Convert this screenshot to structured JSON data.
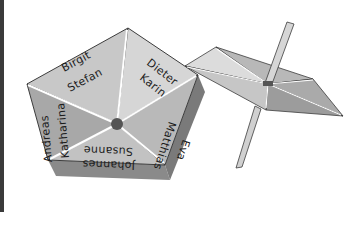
{
  "illustration": {
    "subject": "pentagonal spinner (Kreisel) with names",
    "segments": [
      {
        "names": [
          "Birgit",
          "Stefan"
        ]
      },
      {
        "names": [
          "Dieter",
          "Karin"
        ]
      },
      {
        "names": [
          "Matthias",
          "Eva"
        ]
      },
      {
        "names": [
          "Johannes",
          "Susanne"
        ]
      },
      {
        "names": [
          "Andreas",
          "Katharina"
        ]
      }
    ],
    "colors": {
      "face_light": "#cfcfcf",
      "face_mid": "#b4b4b4",
      "face_dark": "#9a9a9a",
      "side": "#8e8e8e",
      "edge": "#3c3c3c",
      "divider": "#ffffff",
      "hub": "#555555"
    }
  }
}
